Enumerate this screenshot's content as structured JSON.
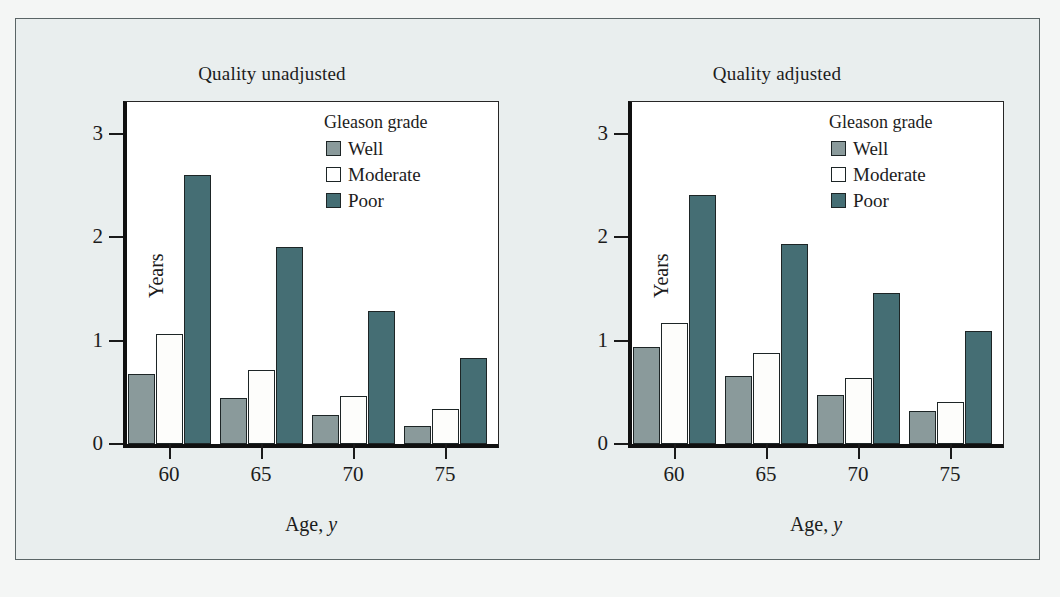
{
  "figure": {
    "background_color": "#f4f6f5",
    "panel_background_color": "#e9eeee",
    "plot_background_color": "#ffffff"
  },
  "colors": {
    "well": "#8a9a9b",
    "moderate": "#ffffff",
    "poor": "#456e74",
    "axis": "#101010",
    "text": "#1c1c1c"
  },
  "legend": {
    "title": "Gleason grade",
    "entries": [
      {
        "label": "Well",
        "swatch": "well"
      },
      {
        "label": "Moderate",
        "swatch": "moderate"
      },
      {
        "label": "Poor",
        "swatch": "poor"
      }
    ]
  },
  "axes": {
    "ylabel": "Years",
    "xlabel_text": "Age,",
    "xlabel_unit": "y",
    "yticks": [
      "3",
      "2",
      "1",
      "0"
    ],
    "xticks": [
      "60",
      "65",
      "70",
      "75"
    ]
  },
  "chart_data": [
    {
      "type": "bar",
      "title": "Quality unadjusted",
      "xlabel": "Age, y",
      "ylabel": "Years",
      "ylim": [
        0,
        3.3
      ],
      "yticks": [
        0,
        1,
        2,
        3
      ],
      "categories": [
        "60",
        "65",
        "70",
        "75"
      ],
      "grid": false,
      "legend_position": "top-right",
      "series": [
        {
          "name": "Well",
          "color": "#8a9a9b",
          "values": [
            0.68,
            0.45,
            0.28,
            0.17
          ]
        },
        {
          "name": "Moderate",
          "color": "#ffffff",
          "values": [
            1.06,
            0.72,
            0.46,
            0.34
          ]
        },
        {
          "name": "Poor",
          "color": "#456e74",
          "values": [
            2.6,
            1.91,
            1.29,
            0.83
          ]
        }
      ]
    },
    {
      "type": "bar",
      "title": "Quality adjusted",
      "xlabel": "Age, y",
      "ylabel": "Years",
      "ylim": [
        0,
        3.3
      ],
      "yticks": [
        0,
        1,
        2,
        3
      ],
      "categories": [
        "60",
        "65",
        "70",
        "75"
      ],
      "grid": false,
      "legend_position": "top-right",
      "series": [
        {
          "name": "Well",
          "color": "#8a9a9b",
          "values": [
            0.94,
            0.66,
            0.47,
            0.32
          ]
        },
        {
          "name": "Moderate",
          "color": "#ffffff",
          "values": [
            1.17,
            0.88,
            0.64,
            0.41
          ]
        },
        {
          "name": "Poor",
          "color": "#456e74",
          "values": [
            2.41,
            1.94,
            1.46,
            1.09
          ]
        }
      ]
    }
  ]
}
